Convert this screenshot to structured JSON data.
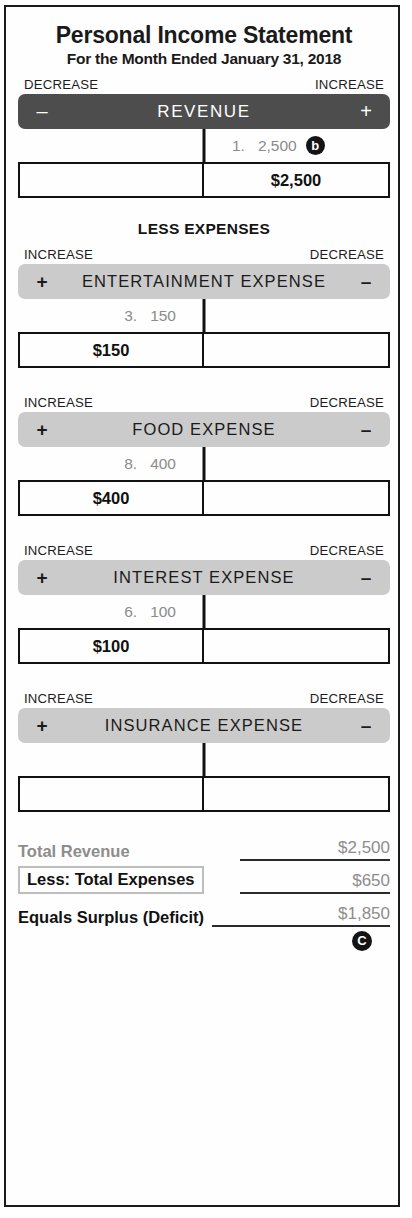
{
  "document": {
    "title": "Personal Income Statement",
    "subtitle": "For the Month Ended January 31, 2018",
    "section_label": "LESS EXPENSES"
  },
  "labels": {
    "increase": "INCREASE",
    "decrease": "DECREASE",
    "plus": "+",
    "minus": "–"
  },
  "accounts": [
    {
      "name": "REVENUE",
      "style": "revenue",
      "left_direction": "DECREASE",
      "right_direction": "INCREASE",
      "left_sign": "–",
      "right_sign": "+",
      "entry_side": "right",
      "entry_ref": "1.",
      "entry_amount": "2,500",
      "entry_badge": "b",
      "balance_side": "right",
      "balance": "$2,500"
    },
    {
      "name": "ENTERTAINMENT  EXPENSE",
      "style": "expense",
      "left_direction": "INCREASE",
      "right_direction": "DECREASE",
      "left_sign": "+",
      "right_sign": "–",
      "entry_side": "left",
      "entry_ref": "3.",
      "entry_amount": "150",
      "entry_badge": "",
      "balance_side": "left",
      "balance": "$150"
    },
    {
      "name": "FOOD  EXPENSE",
      "style": "expense",
      "left_direction": "INCREASE",
      "right_direction": "DECREASE",
      "left_sign": "+",
      "right_sign": "–",
      "entry_side": "left",
      "entry_ref": "8.",
      "entry_amount": "400",
      "entry_badge": "",
      "balance_side": "left",
      "balance": "$400"
    },
    {
      "name": "INTEREST  EXPENSE",
      "style": "expense",
      "left_direction": "INCREASE",
      "right_direction": "DECREASE",
      "left_sign": "+",
      "right_sign": "–",
      "entry_side": "left",
      "entry_ref": "6.",
      "entry_amount": "100",
      "entry_badge": "",
      "balance_side": "left",
      "balance": "$100"
    },
    {
      "name": "INSURANCE  EXPENSE",
      "style": "expense",
      "left_direction": "INCREASE",
      "right_direction": "DECREASE",
      "left_sign": "+",
      "right_sign": "–",
      "entry_side": "left",
      "entry_ref": "",
      "entry_amount": "",
      "entry_badge": "",
      "balance_side": "left",
      "balance": ""
    }
  ],
  "summary": {
    "total_revenue_label": "Total Revenue",
    "total_revenue_amount": "$2,500",
    "total_expenses_label": "Less: Total Expenses",
    "total_expenses_amount": "$650",
    "surplus_label": "Equals Surplus (Deficit)",
    "surplus_amount": "$1,850",
    "badge": "C"
  }
}
